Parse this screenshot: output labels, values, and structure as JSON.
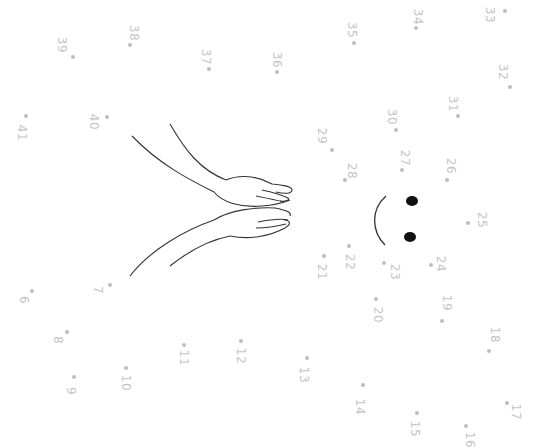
{
  "worksheet": {
    "title": "Connect the dots",
    "orientation": "rotated 90 degrees clockwise",
    "colors": {
      "background": "#ffffff",
      "dot": "#bdbdbd",
      "label": "#c4c4c4",
      "line": "#333333",
      "eye": "#111111"
    },
    "points": [
      {
        "n": "6",
        "dx": 32,
        "dy": 291,
        "lx": 24,
        "ly": 300
      },
      {
        "n": "7",
        "dx": 110,
        "dy": 285,
        "lx": 98,
        "ly": 290
      },
      {
        "n": "8",
        "dx": 67,
        "dy": 332,
        "lx": 58,
        "ly": 340
      },
      {
        "n": "9",
        "dx": 74,
        "dy": 377,
        "lx": 71,
        "ly": 391
      },
      {
        "n": "10",
        "dx": 126,
        "dy": 368,
        "lx": 126,
        "ly": 383
      },
      {
        "n": "11",
        "dx": 184,
        "dy": 345,
        "lx": 184,
        "ly": 358
      },
      {
        "n": "12",
        "dx": 241,
        "dy": 341,
        "lx": 241,
        "ly": 356
      },
      {
        "n": "13",
        "dx": 307,
        "dy": 358,
        "lx": 304,
        "ly": 375
      },
      {
        "n": "14",
        "dx": 363,
        "dy": 385,
        "lx": 360,
        "ly": 407
      },
      {
        "n": "15",
        "dx": 417,
        "dy": 413,
        "lx": 415,
        "ly": 429
      },
      {
        "n": "16",
        "dx": 466,
        "dy": 426,
        "lx": 470,
        "ly": 440
      },
      {
        "n": "17",
        "dx": 507,
        "dy": 403,
        "lx": 516,
        "ly": 412
      },
      {
        "n": "18",
        "dx": 489,
        "dy": 351,
        "lx": 495,
        "ly": 335
      },
      {
        "n": "19",
        "dx": 442,
        "dy": 321,
        "lx": 447,
        "ly": 303
      },
      {
        "n": "20",
        "dx": 376,
        "dy": 299,
        "lx": 378,
        "ly": 315
      },
      {
        "n": "21",
        "dx": 324,
        "dy": 256,
        "lx": 322,
        "ly": 272
      },
      {
        "n": "22",
        "dx": 349,
        "dy": 246,
        "lx": 350,
        "ly": 262
      },
      {
        "n": "23",
        "dx": 384,
        "dy": 263,
        "lx": 395,
        "ly": 272
      },
      {
        "n": "24",
        "dx": 431,
        "dy": 265,
        "lx": 441,
        "ly": 264
      },
      {
        "n": "25",
        "dx": 468,
        "dy": 223,
        "lx": 482,
        "ly": 220
      },
      {
        "n": "26",
        "dx": 447,
        "dy": 180,
        "lx": 451,
        "ly": 166
      },
      {
        "n": "27",
        "dx": 402,
        "dy": 170,
        "lx": 405,
        "ly": 158
      },
      {
        "n": "28",
        "dx": 345,
        "dy": 180,
        "lx": 352,
        "ly": 171
      },
      {
        "n": "29",
        "dx": 332,
        "dy": 150,
        "lx": 322,
        "ly": 136
      },
      {
        "n": "30",
        "dx": 396,
        "dy": 130,
        "lx": 392,
        "ly": 117
      },
      {
        "n": "31",
        "dx": 458,
        "dy": 116,
        "lx": 453,
        "ly": 104
      },
      {
        "n": "32",
        "dx": 510,
        "dy": 87,
        "lx": 503,
        "ly": 72
      },
      {
        "n": "33",
        "dx": 505,
        "dy": 11,
        "lx": 490,
        "ly": 15
      },
      {
        "n": "34",
        "dx": 416,
        "dy": 28,
        "lx": 418,
        "ly": 17
      },
      {
        "n": "35",
        "dx": 354,
        "dy": 43,
        "lx": 352,
        "ly": 30
      },
      {
        "n": "36",
        "dx": 277,
        "dy": 72,
        "lx": 277,
        "ly": 60
      },
      {
        "n": "37",
        "dx": 209,
        "dy": 69,
        "lx": 206,
        "ly": 57
      },
      {
        "n": "38",
        "dx": 130,
        "dy": 45,
        "lx": 134,
        "ly": 33
      },
      {
        "n": "39",
        "dx": 73,
        "dy": 57,
        "lx": 62,
        "ly": 45
      },
      {
        "n": "40",
        "dx": 107,
        "dy": 117,
        "lx": 94,
        "ly": 122
      },
      {
        "n": "41",
        "dx": 26,
        "dy": 116,
        "lx": 22,
        "ly": 133
      }
    ],
    "face": {
      "eyes": [
        {
          "cx": 412,
          "cy": 201
        },
        {
          "cx": 410,
          "cy": 237
        }
      ]
    }
  }
}
